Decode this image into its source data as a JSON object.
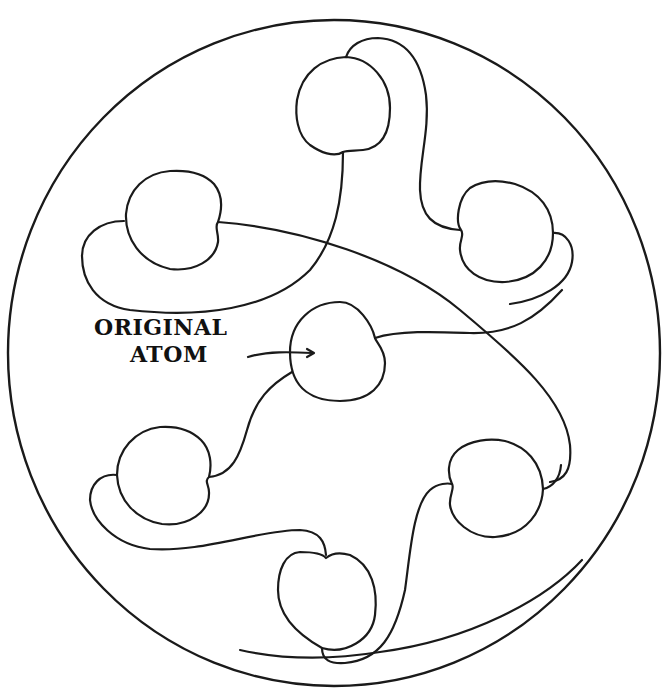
{
  "diagram": {
    "label": {
      "line1": "ORIGINAL",
      "line2": "ATOM"
    },
    "colors": {
      "stroke": "#1a1a1a",
      "background": "#ffffff"
    },
    "outer_boundary": {
      "shape": "circle",
      "cx": 334,
      "cy": 353,
      "rx": 326,
      "ry": 333
    },
    "atoms": [
      {
        "id": "original-atom",
        "cx": 340,
        "cy": 357
      },
      {
        "id": "atom-top",
        "cx": 346,
        "cy": 95
      },
      {
        "id": "atom-upper-left",
        "cx": 166,
        "cy": 227
      },
      {
        "id": "atom-upper-right",
        "cx": 506,
        "cy": 231
      },
      {
        "id": "atom-lower-left",
        "cx": 166,
        "cy": 477
      },
      {
        "id": "atom-lower-right",
        "cx": 486,
        "cy": 485
      },
      {
        "id": "atom-bottom",
        "cx": 326,
        "cy": 601
      }
    ]
  }
}
